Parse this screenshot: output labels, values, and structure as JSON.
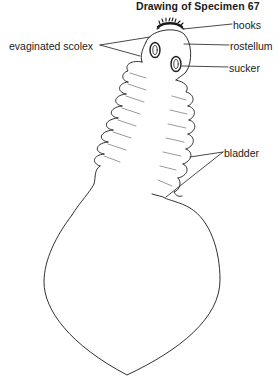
{
  "title": "Drawing of Specimen 67",
  "labels": {
    "hooks": "hooks",
    "rostellum": "rostellum",
    "sucker": "sucker",
    "evaginated_scolex": "evaginated scolex",
    "bladder": "bladder"
  },
  "colors": {
    "ink": "#1a1a1a",
    "background": "#ffffff"
  }
}
